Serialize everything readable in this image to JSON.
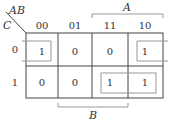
{
  "kmap": {
    "row_var": "C",
    "col_var": "AB",
    "col_labels": [
      "00",
      "01",
      "11",
      "10"
    ],
    "row_labels": [
      "0",
      "1"
    ],
    "cells": [
      [
        "1",
        "0",
        "0",
        "1"
      ],
      [
        "0",
        "0",
        "1",
        "1"
      ]
    ],
    "brackets": {
      "top": {
        "label": "A",
        "span_columns": [
          "11",
          "10"
        ]
      },
      "bottom": {
        "label": "B",
        "span_columns": [
          "01",
          "11"
        ]
      }
    },
    "groups": [
      {
        "name": "wraparound-row0",
        "cells": [
          [
            0,
            0
          ],
          [
            0,
            3
          ]
        ]
      },
      {
        "name": "row1-right-pair",
        "cells": [
          [
            1,
            2
          ],
          [
            1,
            3
          ]
        ]
      }
    ]
  }
}
